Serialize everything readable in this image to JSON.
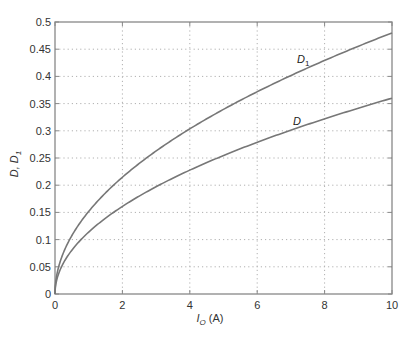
{
  "chart_data": {
    "type": "line",
    "title": "",
    "xlabel": "I_O (A)",
    "xlabel_main": "I",
    "xlabel_sub": "O",
    "xlabel_unit": "(A)",
    "ylabel": "D, D1",
    "ylabel_main": "D, D",
    "ylabel_sub": "1",
    "xlim": [
      0,
      10
    ],
    "ylim": [
      0,
      0.5
    ],
    "xticks": [
      "0",
      "2",
      "4",
      "6",
      "8",
      "10"
    ],
    "yticks": [
      "0",
      "0.05",
      "0.1",
      "0.15",
      "0.2",
      "0.25",
      "0.3",
      "0.35",
      "0.4",
      "0.45",
      "0.5"
    ],
    "grid": true,
    "legend": "none (inline curve labels)",
    "x": [
      0,
      0.25,
      0.5,
      1,
      2,
      3,
      4,
      5,
      6,
      7,
      8,
      9,
      10
    ],
    "series": [
      {
        "name": "D1",
        "label_main": "D",
        "label_sub": "1",
        "values": [
          0,
          0.076,
          0.107,
          0.152,
          0.215,
          0.263,
          0.304,
          0.339,
          0.372,
          0.402,
          0.429,
          0.455,
          0.48
        ]
      },
      {
        "name": "D",
        "label_main": "D",
        "label_sub": "",
        "values": [
          0,
          0.057,
          0.08,
          0.114,
          0.161,
          0.197,
          0.228,
          0.255,
          0.279,
          0.301,
          0.322,
          0.342,
          0.36
        ]
      }
    ],
    "annotations": [
      {
        "text": "D1",
        "x": 7.2,
        "y": 0.43
      },
      {
        "text": "D",
        "x": 7.1,
        "y": 0.32
      }
    ],
    "colors": {
      "curve": "#777777",
      "axis": "#888888",
      "grid": "#b0b0b0"
    }
  }
}
